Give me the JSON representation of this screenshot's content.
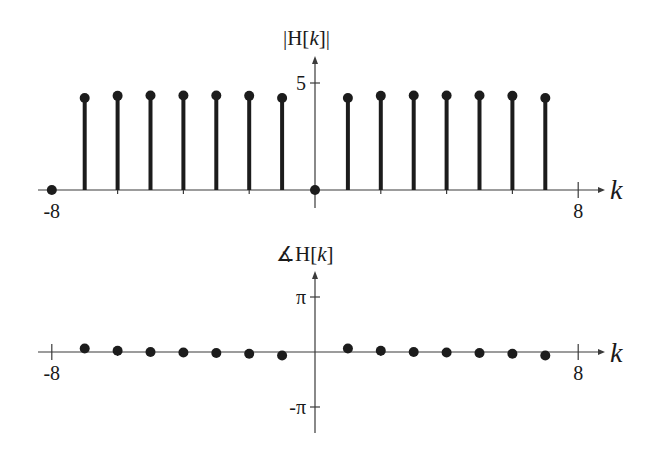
{
  "chart_data": [
    {
      "type": "stem",
      "title": "|H[k]|",
      "title_parts": {
        "pre": "|H[",
        "var": "k",
        "post": "]|"
      },
      "xlabel": "k",
      "ylabel": "|H[k]|",
      "x": [
        -8,
        -7,
        -6,
        -5,
        -4,
        -3,
        -2,
        -1,
        0,
        1,
        2,
        3,
        4,
        5,
        6,
        7
      ],
      "values": [
        0,
        4.3,
        4.4,
        4.42,
        4.42,
        4.42,
        4.4,
        4.3,
        0,
        4.3,
        4.4,
        4.42,
        4.42,
        4.42,
        4.4,
        4.3
      ],
      "xticks": [
        {
          "value": -8,
          "label": "-8"
        },
        {
          "value": 8,
          "label": "8"
        }
      ],
      "yticks": [
        {
          "value": 5,
          "label": "5"
        }
      ],
      "xlim": [
        -8.5,
        8.8
      ],
      "ylim": [
        0,
        6
      ],
      "grid": false,
      "legend": null
    },
    {
      "type": "scatter",
      "title": "∡H[k]",
      "title_parts": {
        "pre": "∡H[",
        "var": "k",
        "post": "]"
      },
      "xlabel": "k",
      "ylabel": "∡H[k]",
      "x": [
        -7,
        -6,
        -5,
        -4,
        -3,
        -2,
        -1,
        1,
        2,
        3,
        4,
        5,
        6,
        7
      ],
      "values": [
        0.2,
        0.07,
        0.0,
        -0.03,
        -0.06,
        -0.1,
        -0.2,
        0.2,
        0.07,
        0.0,
        -0.03,
        -0.06,
        -0.1,
        -0.2
      ],
      "xticks": [
        {
          "value": -8,
          "label": "-8"
        },
        {
          "value": 8,
          "label": "8"
        }
      ],
      "yticks": [
        {
          "value": 3.14159,
          "label": "π"
        },
        {
          "value": -3.14159,
          "label": "-π"
        }
      ],
      "xlim": [
        -8.5,
        8.8
      ],
      "ylim": [
        -3.14159,
        3.14159
      ],
      "grid": false,
      "legend": null
    }
  ],
  "colors": {
    "ink": "#1c1c1c",
    "axis": "#3a3a3a",
    "background": "#ffffff"
  }
}
